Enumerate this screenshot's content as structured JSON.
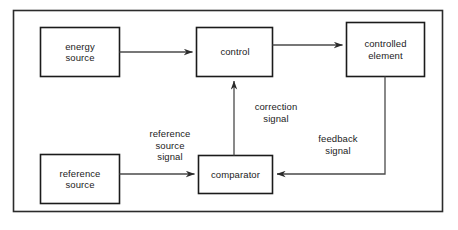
{
  "diagram": {
    "type": "block-diagram",
    "frame": {
      "stroke": "#2b2b2b",
      "fill": "#ffffff"
    },
    "box_stroke": "#1b1b1b",
    "connector_stroke": "#4a4a4a",
    "nodes": [
      {
        "id": "energy-source",
        "label": "energy\nsource"
      },
      {
        "id": "control",
        "label": "control"
      },
      {
        "id": "controlled-element",
        "label": "controlled\nelement"
      },
      {
        "id": "reference-source",
        "label": "reference\nsource"
      },
      {
        "id": "comparator",
        "label": "comparator"
      }
    ],
    "edges": [
      {
        "id": "energy-to-control",
        "label": ""
      },
      {
        "id": "control-to-controlled-element",
        "label": ""
      },
      {
        "id": "reference-to-comparator",
        "label": "reference\nsource\nsignal"
      },
      {
        "id": "comparator-to-control",
        "label": "correction\nsignal"
      },
      {
        "id": "controlled-element-to-comparator",
        "label": "feedback\nsignal"
      }
    ]
  }
}
